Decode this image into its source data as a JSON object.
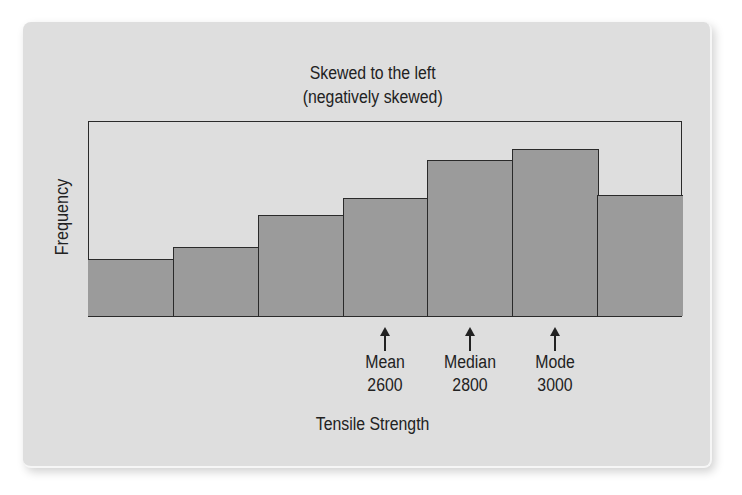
{
  "chart_data": {
    "type": "bar",
    "title": "Skewed to the left",
    "subtitle": "(negatively skewed)",
    "xlabel": "Tensile Strength",
    "ylabel": "Frequency",
    "categories": [
      "bin1",
      "bin2",
      "bin3",
      "bin4",
      "bin5",
      "bin6",
      "bin7"
    ],
    "values": [
      57,
      69,
      101,
      118,
      156,
      167,
      121
    ],
    "ylim": [
      0,
      196
    ],
    "grid": false,
    "legend": null,
    "annotations": [
      {
        "label": "Mean",
        "value": "2600",
        "bin_boundary": 4
      },
      {
        "label": "Median",
        "value": "2800",
        "bin_boundary": 5
      },
      {
        "label": "Mode",
        "value": "3000",
        "bin_boundary": 6
      }
    ]
  },
  "colors": {
    "card_bg": "#dedede",
    "bar_fill": "#9b9b9b",
    "outline": "#2a2a2a",
    "text": "#222222"
  }
}
